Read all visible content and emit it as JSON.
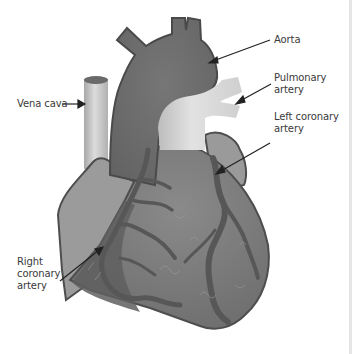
{
  "diagram": {
    "style": "grayscale illustration",
    "colors": {
      "background": "#ffffff",
      "heart_body": "#7d7d7d",
      "heart_dark": "#5f5f5f",
      "aorta": "#6e6e6e",
      "atrium_light": "#9a9a9a",
      "pulmonary_artery": "#d2d2d2",
      "vena_cava": "#c4c4c4",
      "vessel": "#585858",
      "outline": "#4a4a4a",
      "label_text": "#3a3a3a",
      "arrow": "#222222"
    },
    "labels": [
      {
        "id": "aorta",
        "lines": [
          "Aorta"
        ]
      },
      {
        "id": "pulmonary-artery",
        "lines": [
          "Pulmonary",
          "artery"
        ]
      },
      {
        "id": "vena-cava",
        "lines": [
          "Vena cava"
        ]
      },
      {
        "id": "left-coronary-artery",
        "lines": [
          "Left coronary",
          "artery"
        ]
      },
      {
        "id": "right-coronary-artery",
        "lines": [
          "Right",
          "coronary",
          "artery"
        ]
      }
    ]
  }
}
